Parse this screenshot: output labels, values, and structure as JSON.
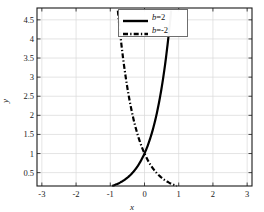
{
  "chart_data": {
    "type": "line",
    "title": "",
    "xlabel": "x",
    "ylabel": "y",
    "xlim": [
      -3.1416,
      3.1416
    ],
    "ylim": [
      0.15,
      4.81
    ],
    "grid": true,
    "legend_position": "top-center",
    "xticks": [
      -3,
      -2,
      -1,
      0,
      1,
      2,
      3
    ],
    "xticklabels": [
      "-3",
      "-2",
      "-1",
      "0",
      "1",
      "2",
      "3"
    ],
    "yticks": [
      0.5,
      1,
      1.5,
      2,
      2.5,
      3,
      3.5,
      4,
      4.5
    ],
    "yticklabels": [
      "0.5",
      "1",
      "1.5",
      "2",
      "2.5",
      "3",
      "3.5",
      "4",
      "4.5"
    ],
    "series": [
      {
        "name": "b=2",
        "label_prefix": "b",
        "label_value": "=2",
        "style": "solid",
        "color": "#000000",
        "width": 2.2,
        "x": [
          -3.1416,
          -2.8,
          -2.6,
          -2.4,
          -2.2,
          -2.0,
          -1.8,
          -1.6,
          -1.4,
          -1.2,
          -1.0,
          -0.8,
          -0.6,
          -0.4,
          -0.2,
          0.0,
          0.2,
          0.4,
          0.5,
          0.6,
          0.7,
          0.8,
          0.9,
          1.0,
          1.1,
          1.2,
          1.3,
          1.4,
          1.5,
          1.5708
        ],
        "y": [
          0.1874,
          0.207,
          0.2541,
          0.3078,
          0.3714,
          0.4493,
          0.5433,
          0.657,
          0.7946,
          0.961,
          1.1623,
          1.4057,
          1.7001,
          2.0562,
          2.4871,
          3.0083,
          3.6386,
          4.4005,
          4.8105,
          4.8105,
          4.8105,
          4.8105,
          4.8105,
          4.8105,
          4.8105,
          4.8105,
          4.8105,
          4.8105,
          4.8105,
          4.8105
        ]
      },
      {
        "name": "b=-2",
        "label_prefix": "b",
        "label_value": "=-2",
        "style": "dashdot",
        "color": "#000000",
        "width": 2.2,
        "x": [
          -1.5708,
          -1.5,
          -1.4,
          -1.3,
          -1.2,
          -1.1,
          -1.0,
          -0.9,
          -0.8,
          -0.7,
          -0.6,
          -0.5,
          -0.4,
          -0.2,
          0.0,
          0.2,
          0.4,
          0.6,
          0.8,
          1.0,
          1.2,
          1.4,
          1.6,
          1.8,
          2.0,
          2.2,
          2.4,
          2.6,
          2.8,
          3.1416
        ],
        "y": [
          4.8105,
          4.8105,
          4.8105,
          4.8105,
          4.8105,
          4.8105,
          4.8105,
          4.8105,
          4.8105,
          4.8105,
          4.8105,
          4.8105,
          4.4005,
          2.4871,
          1.533,
          1.0,
          0.6703,
          0.4493,
          0.3012,
          0.2019,
          0.1353,
          0.0907,
          0.0608,
          0.0408,
          0.0273,
          0.0183,
          0.0123,
          0.0082,
          0.0055,
          0.0019
        ]
      }
    ],
    "formula": "y = e^(b*x)",
    "colors": {
      "axis": "#1a1a1a",
      "grid": "#d9d9d9",
      "curve": "#000000",
      "background": "#ffffff",
      "legend_border": "#6e6e6e"
    }
  }
}
